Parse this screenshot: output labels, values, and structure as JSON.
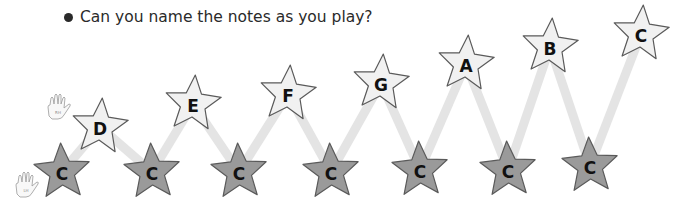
{
  "prompt": {
    "bullet": "•",
    "text": "Can you name the notes as you play?"
  },
  "colors": {
    "dark_star_fill": "#9a9a9a",
    "light_star_fill": "#f1f1f1",
    "star_stroke": "#5a5a5a",
    "path_color": "#e4e4e4",
    "text_color": "#2a2a2a"
  },
  "hands": [
    {
      "name": "right-hand",
      "label": "RH",
      "x": 58,
      "y": 110
    },
    {
      "name": "left-hand",
      "label": "LH",
      "x": 26,
      "y": 188
    }
  ],
  "stars": [
    {
      "note": "C",
      "type": "dark",
      "x": 62,
      "y": 172
    },
    {
      "note": "D",
      "type": "light",
      "x": 100,
      "y": 127
    },
    {
      "note": "C",
      "type": "dark",
      "x": 152,
      "y": 172
    },
    {
      "note": "E",
      "type": "light",
      "x": 193,
      "y": 104
    },
    {
      "note": "C",
      "type": "dark",
      "x": 239,
      "y": 172
    },
    {
      "note": "F",
      "type": "light",
      "x": 288,
      "y": 94
    },
    {
      "note": "C",
      "type": "dark",
      "x": 331,
      "y": 172
    },
    {
      "note": "G",
      "type": "light",
      "x": 381,
      "y": 83
    },
    {
      "note": "C",
      "type": "dark",
      "x": 420,
      "y": 170
    },
    {
      "note": "A",
      "type": "light",
      "x": 466,
      "y": 64
    },
    {
      "note": "C",
      "type": "dark",
      "x": 508,
      "y": 170
    },
    {
      "note": "B",
      "type": "light",
      "x": 550,
      "y": 47
    },
    {
      "note": "C",
      "type": "dark",
      "x": 590,
      "y": 166
    },
    {
      "note": "C",
      "type": "light",
      "x": 641,
      "y": 34
    }
  ]
}
